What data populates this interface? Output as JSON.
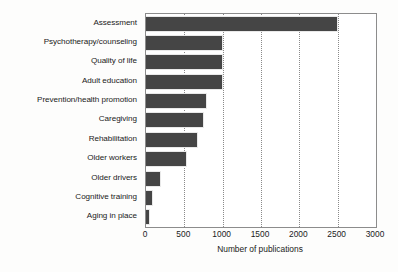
{
  "chart_data": {
    "type": "bar",
    "orientation": "horizontal",
    "title": "",
    "xlabel": "Number of publications",
    "ylabel": "",
    "xlim": [
      0,
      3000
    ],
    "xticks": [
      0,
      500,
      1000,
      1500,
      2000,
      2500,
      3000
    ],
    "xtick_labels": [
      "0",
      "500",
      "1000",
      "1500",
      "2000",
      "2500",
      "3000"
    ],
    "grid": "vertical-dotted",
    "legend": "none",
    "bar_color": "#454545",
    "categories": [
      "Assessment",
      "Psychotherapy/counseling",
      "Quality of life",
      "Adult education",
      "Prevention/health promotion",
      "Caregiving",
      "Rehabilitation",
      "Older workers",
      "Older drivers",
      "Cognitive training",
      "Aging in place"
    ],
    "values": [
      2500,
      1000,
      1000,
      1000,
      790,
      750,
      680,
      540,
      190,
      90,
      55
    ]
  }
}
